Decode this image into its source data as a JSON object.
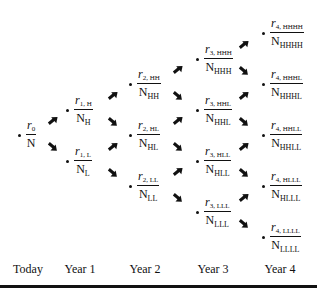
{
  "diagram": {
    "type": "binomial interest rate tree",
    "periods": [
      "Today",
      "Year 1",
      "Year 2",
      "Year 3",
      "Year 4"
    ],
    "nodes": [
      {
        "id": "n0",
        "period": 0,
        "num_sym": "r",
        "num_sub": "0",
        "den_sym": "N",
        "den_sub": ""
      },
      {
        "id": "n1H",
        "period": 1,
        "num_sym": "r",
        "num_sub": "1, H",
        "den_sym": "N",
        "den_sub": "H"
      },
      {
        "id": "n1L",
        "period": 1,
        "num_sym": "r",
        "num_sub": "1, L",
        "den_sym": "N",
        "den_sub": "L"
      },
      {
        "id": "n2HH",
        "period": 2,
        "num_sym": "r",
        "num_sub": "2, HH",
        "den_sym": "N",
        "den_sub": "HH"
      },
      {
        "id": "n2HL",
        "period": 2,
        "num_sym": "r",
        "num_sub": "2, HL",
        "den_sym": "N",
        "den_sub": "HL"
      },
      {
        "id": "n2LL",
        "period": 2,
        "num_sym": "r",
        "num_sub": "2, LL",
        "den_sym": "N",
        "den_sub": "LL"
      },
      {
        "id": "n3HHH",
        "period": 3,
        "num_sym": "r",
        "num_sub": "3, HHH",
        "den_sym": "N",
        "den_sub": "HHH"
      },
      {
        "id": "n3HHL",
        "period": 3,
        "num_sym": "r",
        "num_sub": "3, HHL",
        "den_sym": "N",
        "den_sub": "HHL"
      },
      {
        "id": "n3HLL",
        "period": 3,
        "num_sym": "r",
        "num_sub": "3, HLL",
        "den_sym": "N",
        "den_sub": "HLL"
      },
      {
        "id": "n3LLL",
        "period": 3,
        "num_sym": "r",
        "num_sub": "3, LLL",
        "den_sym": "N",
        "den_sub": "LLL"
      },
      {
        "id": "n4HHHH",
        "period": 4,
        "num_sym": "r",
        "num_sub": "4, HHHH",
        "den_sym": "N",
        "den_sub": "HHHH"
      },
      {
        "id": "n4HHHL",
        "period": 4,
        "num_sym": "r",
        "num_sub": "4, HHHL",
        "den_sym": "N",
        "den_sub": "HHHL"
      },
      {
        "id": "n4HHLL",
        "period": 4,
        "num_sym": "r",
        "num_sub": "4, HHLL",
        "den_sym": "N",
        "den_sub": "HHLL"
      },
      {
        "id": "n4HLLL",
        "period": 4,
        "num_sym": "r",
        "num_sub": "4, HLLL",
        "den_sym": "N",
        "den_sub": "HLLL"
      },
      {
        "id": "n4LLLL",
        "period": 4,
        "num_sym": "r",
        "num_sub": "4, LLLL",
        "den_sym": "N",
        "den_sub": "LLLL"
      }
    ]
  }
}
